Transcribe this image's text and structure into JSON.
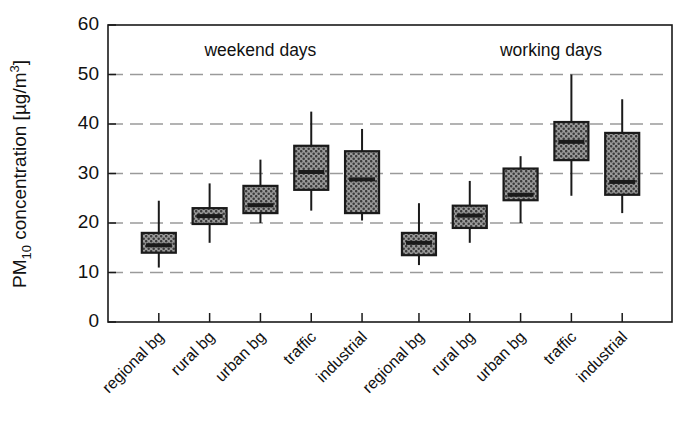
{
  "chart_data": {
    "type": "box",
    "title": "",
    "xlabel": "",
    "ylabel": "PM10 concentration [µg/m³]",
    "ylabel_parts": {
      "prefix": "PM",
      "subscript": "10",
      "middle": " concentration [µg/m",
      "superscript": "3",
      "suffix": "]"
    },
    "ylim": [
      0,
      60
    ],
    "yticks": [
      0,
      10,
      20,
      30,
      40,
      50,
      60
    ],
    "ytick_labels": [
      "0",
      "10",
      "20",
      "30",
      "40",
      "50",
      "60"
    ],
    "grid": "horizontal-dashed",
    "gridlines": [
      10,
      20,
      30,
      40,
      50
    ],
    "legend": "none",
    "group_annotations": [
      {
        "label": "weekend days",
        "x_index_center": 2.0
      },
      {
        "label": "working days",
        "x_index_center": 7.6
      }
    ],
    "categories": [
      "regional bg",
      "rural bg",
      "urban bg",
      "traffic",
      "industrial",
      "regional bg",
      "rural bg",
      "urban bg",
      "traffic",
      "industrial"
    ],
    "groups": [
      "weekend days",
      "weekend days",
      "weekend days",
      "weekend days",
      "weekend days",
      "working days",
      "working days",
      "working days",
      "working days",
      "working days"
    ],
    "boxes": [
      {
        "category": "regional bg",
        "group": "weekend days",
        "whisker_low": 11.0,
        "q1": 14.0,
        "median": 15.5,
        "q3": 18.0,
        "whisker_high": 24.5
      },
      {
        "category": "rural bg",
        "group": "weekend days",
        "whisker_low": 16.0,
        "q1": 19.8,
        "median": 21.4,
        "q3": 23.0,
        "whisker_high": 28.0
      },
      {
        "category": "urban bg",
        "group": "weekend days",
        "whisker_low": 20.0,
        "q1": 22.0,
        "median": 23.6,
        "q3": 27.5,
        "whisker_high": 32.8
      },
      {
        "category": "traffic",
        "group": "weekend days",
        "whisker_low": 22.5,
        "q1": 26.7,
        "median": 30.3,
        "q3": 35.6,
        "whisker_high": 42.5
      },
      {
        "category": "industrial",
        "group": "weekend days",
        "whisker_low": 20.5,
        "q1": 22.0,
        "median": 28.8,
        "q3": 34.5,
        "whisker_high": 39.0
      },
      {
        "category": "regional bg",
        "group": "working days",
        "whisker_low": 11.5,
        "q1": 13.5,
        "median": 16.0,
        "q3": 18.0,
        "whisker_high": 24.0
      },
      {
        "category": "rural bg",
        "group": "working days",
        "whisker_low": 16.0,
        "q1": 19.0,
        "median": 21.5,
        "q3": 23.5,
        "whisker_high": 28.5
      },
      {
        "category": "urban bg",
        "group": "working days",
        "whisker_low": 20.0,
        "q1": 24.6,
        "median": 25.7,
        "q3": 31.0,
        "whisker_high": 33.5
      },
      {
        "category": "traffic",
        "group": "working days",
        "whisker_low": 25.5,
        "q1": 32.7,
        "median": 36.4,
        "q3": 40.4,
        "whisker_high": 50.0
      },
      {
        "category": "industrial",
        "group": "working days",
        "whisker_low": 22.0,
        "q1": 25.7,
        "median": 28.3,
        "q3": 38.2,
        "whisker_high": 45.0
      }
    ],
    "colors": {
      "box_fill": "#8f8f8f",
      "box_edge": "#1a1a1a",
      "grid": "#9a9a9a",
      "axis": "#1a1a1a",
      "text": "#111111"
    }
  }
}
